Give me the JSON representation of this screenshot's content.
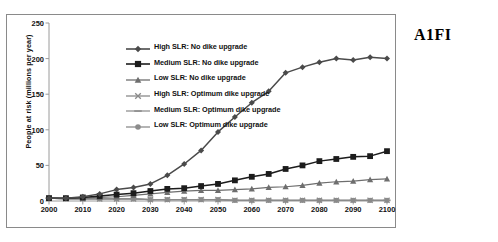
{
  "scenario_tag": "A1FI",
  "chart_data": {
    "type": "line",
    "title": "",
    "xlabel": "",
    "ylabel": "People at risk (millions per year)",
    "xlim": [
      2000,
      2100
    ],
    "ylim": [
      0,
      250
    ],
    "yticks": [
      0,
      50,
      100,
      150,
      200,
      250
    ],
    "xticks": [
      2000,
      2010,
      2020,
      2030,
      2040,
      2050,
      2060,
      2070,
      2080,
      2090,
      2100
    ],
    "x": [
      2000,
      2005,
      2010,
      2015,
      2020,
      2025,
      2030,
      2035,
      2040,
      2045,
      2050,
      2055,
      2060,
      2065,
      2070,
      2075,
      2080,
      2085,
      2090,
      2095,
      2100
    ],
    "grid": false,
    "legend_position": "upper-left-inside",
    "series": [
      {
        "name": "High SLR: No dike upgrade",
        "marker": "diamond",
        "color": "#4a4a4a",
        "values": [
          4,
          4,
          6,
          10,
          16,
          19,
          24,
          36,
          52,
          71,
          97,
          118,
          138,
          154,
          180,
          188,
          195,
          200,
          198,
          202,
          200
        ]
      },
      {
        "name": "Medium SLR: No dike upgrade",
        "marker": "square",
        "color": "#1c1c1c",
        "values": [
          4,
          4,
          5,
          7,
          9,
          11,
          14,
          17,
          18,
          21,
          24,
          29,
          34,
          38,
          45,
          50,
          56,
          59,
          62,
          63,
          70
        ]
      },
      {
        "name": "Low SLR: No dike upgrade",
        "marker": "triangle",
        "color": "#6e6e6e",
        "values": [
          4,
          4,
          4,
          5,
          6,
          8,
          10,
          12,
          14,
          15,
          15,
          16,
          17,
          19,
          20,
          22,
          25,
          27,
          28,
          30,
          31
        ]
      },
      {
        "name": "High SLR: Optimum dike upgrade",
        "marker": "x",
        "color": "#8a8a8a",
        "values": [
          4,
          3,
          3,
          3,
          3,
          3,
          2,
          2,
          2,
          2,
          2,
          1,
          1,
          1,
          1,
          1,
          1,
          1,
          1,
          1,
          1
        ]
      },
      {
        "name": "Medium SLR:  Optimum dike upgrade",
        "marker": "dash",
        "color": "#909090",
        "values": [
          4,
          3,
          3,
          3,
          3,
          3,
          2,
          2,
          2,
          2,
          2,
          1,
          1,
          1,
          1,
          1,
          1,
          1,
          1,
          1,
          1
        ]
      },
      {
        "name": "Low SLR: Optimum dike upgrade",
        "marker": "circle",
        "color": "#8c8c8c",
        "values": [
          4,
          3,
          3,
          3,
          3,
          3,
          2,
          2,
          2,
          2,
          2,
          1,
          1,
          1,
          1,
          1,
          1,
          1,
          1,
          1,
          1
        ]
      }
    ]
  }
}
